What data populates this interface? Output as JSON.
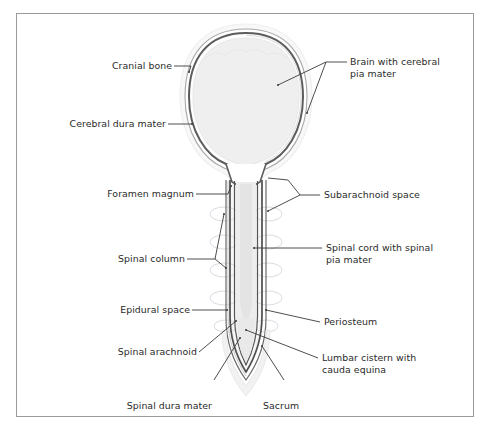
{
  "figure": {
    "frame": {
      "border_color": "#9a9a9a"
    },
    "colors": {
      "outline_dark": "#4a4a4a",
      "outline_mid": "#7d7d7d",
      "fill_light": "#f1f1f1",
      "fill_halo": "#f7f7f7",
      "vertebra_line": "#d8d4dc",
      "leader_line": "#3a3a3a",
      "text": "#2b2b2b"
    }
  },
  "labels": {
    "cranial_bone": "Cranial bone",
    "cerebral_dura_mater": "Cerebral dura mater",
    "foramen_magnum": "Foramen magnum",
    "spinal_column": "Spinal column",
    "epidural_space": "Epidural space",
    "spinal_arachnoid": "Spinal arachnoid",
    "spinal_dura_mater": "Spinal dura mater",
    "sacrum": "Sacrum",
    "brain_with_cerebral_pia_mater": "Brain with cerebral\npia mater",
    "subarachnoid_space": "Subarachnoid space",
    "spinal_cord_with_spinal_pia_mater": "Spinal cord with spinal\npia mater",
    "periosteum": "Periosteum",
    "lumbar_cistern_with_cauda_equina": "Lumbar cistern with\ncauda equina"
  }
}
